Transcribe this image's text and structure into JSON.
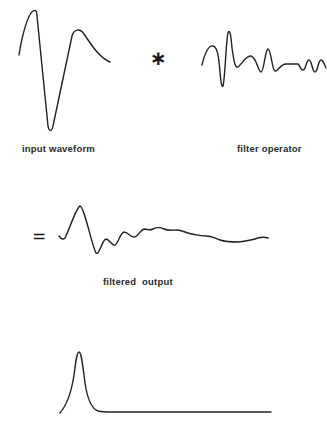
{
  "diagram": {
    "colors": {
      "stroke": "#222222",
      "background": "#ffffff",
      "text": "#2a2a2a"
    },
    "operators": {
      "convolve": "∗",
      "equals": "="
    },
    "labels": {
      "input": "input waveform",
      "filter": "filter operator",
      "output": "filtered output"
    },
    "traces": {
      "input_waveform": "M19,55 C22,35 28,14 33,11 C36,9 37,12 37,16 L48,126 C49,132 52,132 53,126 L72,36 C74,29 80,28 84,34 C92,46 100,58 110,62",
      "filter_operator": "M202,65 C205,52 209,45 213,46 C218,47 219,60 220,72 C221,84 222,88 223,86 C225,80 226,40 228,33 C230,28 231,36 232,48 C234,62 235,68 238,67 C242,64 246,55 251,56 C257,58 258,72 261,72 C264,72 265,50 268,49 C271,49 272,70 275,71 C278,72 280,64 286,64 L298,64 C300,65 300,70 303,70 C306,70 306,60 309,60 C312,60 312,72 315,72 C318,72 318,60 321,60 C324,61 325,66 326,68",
      "filtered_output": "M59,236 C61,239 63,240 65,238 C70,228 76,208 80,206 C84,206 92,246 96,253 C99,256 102,240 106,239 C109,239 112,246 115,245 C118,244 120,233 124,232 C128,232 130,237 134,237 C138,237 140,230 144,229 C148,229 149,231 153,229 C157,227 160,227 164,229 C168,231 172,230 178,230 C184,231 186,233 192,234 C198,235 200,236 206,236 C212,236 214,238 220,240 C226,242 230,242 238,242 C246,241 252,240 258,238 C262,237 265,237 268,238",
      "desired_spike": "M60,413 C66,406 71,395 74,375 C76,360 77,352 79,352 C81,352 82,360 84,375 C86,395 90,408 98,411 C102,412 106,412 112,412 L271,412"
    }
  }
}
